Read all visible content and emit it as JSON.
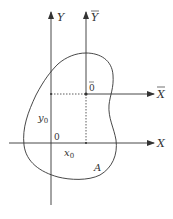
{
  "diagram": {
    "labels": {
      "y_axis": "Y",
      "ybar_axis": "Y",
      "x_axis": "X",
      "xbar_axis": "X",
      "origin": "0",
      "centroid_origin": "0",
      "y0": "y",
      "y0_sub": "0",
      "x0": "x",
      "x0_sub": "0",
      "area": "A"
    },
    "colors": {
      "stroke": "#333333",
      "background": "#ffffff"
    }
  }
}
